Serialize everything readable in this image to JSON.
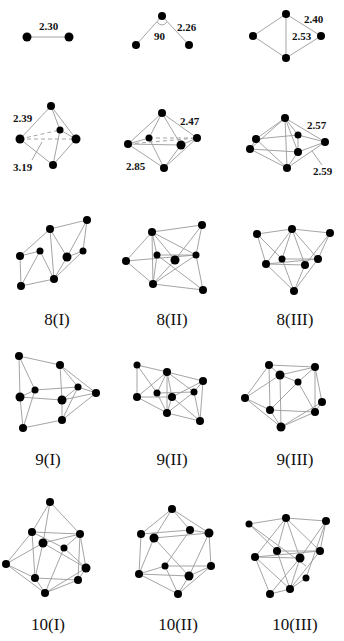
{
  "figure": {
    "colors": {
      "atom": "#000000",
      "bond": "#9a9a9a",
      "text": "#111111"
    },
    "row1": {
      "dimer": {
        "bond_label": "2.30"
      },
      "trimer": {
        "angle_label": "90",
        "bond_label": "2.26"
      },
      "tetramer": {
        "bond_label_a": "2.40",
        "bond_label_b": "2.53"
      }
    },
    "row2": {
      "n5": {
        "bond_label_a": "2.39",
        "bond_label_b": "3.19"
      },
      "n6": {
        "bond_label_a": "2.47",
        "bond_label_b": "2.85"
      },
      "n7": {
        "bond_label_a": "2.57",
        "bond_label_b": "2.59"
      }
    },
    "captions": {
      "c8_1": "8(I)",
      "c8_2": "8(II)",
      "c8_3": "8(III)",
      "c9_1": "9(I)",
      "c9_2": "9(II)",
      "c9_3": "9(III)",
      "c10_1": "10(I)",
      "c10_2": "10(II)",
      "c10_3": "10(III)"
    }
  }
}
